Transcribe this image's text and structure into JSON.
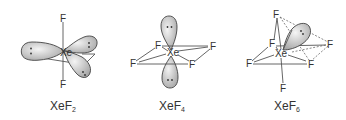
{
  "figure": {
    "molecules": [
      {
        "id": "xef2",
        "label_base": "XeF",
        "label_sub": "2",
        "central_atom": "Xe",
        "ligand_atom": "F",
        "ligand_count": 2,
        "lone_pairs": 3,
        "geometry": "linear"
      },
      {
        "id": "xef4",
        "label_base": "XeF",
        "label_sub": "4",
        "central_atom": "Xe",
        "ligand_atom": "F",
        "ligand_count": 4,
        "lone_pairs": 2,
        "geometry": "square planar"
      },
      {
        "id": "xef6",
        "label_base": "XeF",
        "label_sub": "6",
        "central_atom": "Xe",
        "ligand_atom": "F",
        "ligand_count": 6,
        "lone_pairs": 1,
        "geometry": "distorted octahedral"
      }
    ],
    "colors": {
      "lobe_fill_light": "#f2f2f2",
      "lobe_fill_dark": "#a8a8a8",
      "line": "#555555",
      "text": "#333333"
    }
  }
}
